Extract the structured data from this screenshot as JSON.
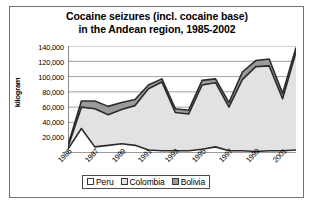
{
  "chart_data": {
    "type": "area",
    "stacked": true,
    "title": "Cocaine seizures (incl. cocaine base) in the Andean region, 1985-2002",
    "title_lines": [
      "Cocaine seizures (incl. cocaine base)",
      "in the Andean region, 1985-2002"
    ],
    "xlabel": "",
    "ylabel": "kilogram",
    "ylim": [
      0,
      140000
    ],
    "ytick_values": [
      140000,
      120000,
      100000,
      80000,
      60000,
      40000,
      20000,
      0
    ],
    "ytick_labels": [
      "140,000",
      "120,000",
      "100,000",
      "80,000",
      "60,000",
      "40,000",
      "20,000",
      "-"
    ],
    "grid": true,
    "grid_axis": "y",
    "legend_position": "bottom",
    "x": [
      1985,
      1986,
      1987,
      1988,
      1989,
      1990,
      1991,
      1992,
      1993,
      1994,
      1995,
      1996,
      1997,
      1998,
      1999,
      2000,
      2001,
      2002
    ],
    "xtick_labels": [
      "1985",
      "1987",
      "1989",
      "1991",
      "1993",
      "1995",
      "1997",
      "1999",
      "2001"
    ],
    "xtick_values": [
      1985,
      1987,
      1989,
      1991,
      1993,
      1995,
      1997,
      1999,
      2001
    ],
    "series": [
      {
        "name": "Bolivia",
        "color": "#9a9a9a",
        "values": [
          2000,
          8000,
          10000,
          11000,
          9000,
          8000,
          5000,
          4000,
          5000,
          5000,
          6000,
          5000,
          6000,
          10000,
          8000,
          9000,
          7000,
          6000
        ]
      },
      {
        "name": "Colombia",
        "color": "#e2e2e2",
        "values": [
          3000,
          28000,
          50000,
          40000,
          45000,
          52000,
          80000,
          90000,
          50000,
          48000,
          84000,
          84000,
          57000,
          93000,
          111000,
          111000,
          68000,
          128000
        ]
      },
      {
        "name": "Peru",
        "color": "#ffffff",
        "values": [
          5000,
          32000,
          8000,
          10000,
          12000,
          10000,
          4000,
          3000,
          3000,
          3000,
          5000,
          8000,
          3000,
          3000,
          2000,
          3000,
          3000,
          4000
        ]
      }
    ],
    "series_stack_order_bottom_to_top": [
      "Peru",
      "Colombia",
      "Bolivia"
    ],
    "totals": [
      10000,
      68000,
      68000,
      61000,
      66000,
      70000,
      89000,
      97000,
      58000,
      56000,
      95000,
      97000,
      66000,
      106000,
      121000,
      123000,
      78000,
      138000
    ]
  },
  "legend": {
    "items": [
      {
        "label": "Peru",
        "swatch": "peru-swatch"
      },
      {
        "label": "Colombia",
        "swatch": "colombia-swatch"
      },
      {
        "label": "Bolivia",
        "swatch": "bolivia-swatch"
      }
    ]
  }
}
